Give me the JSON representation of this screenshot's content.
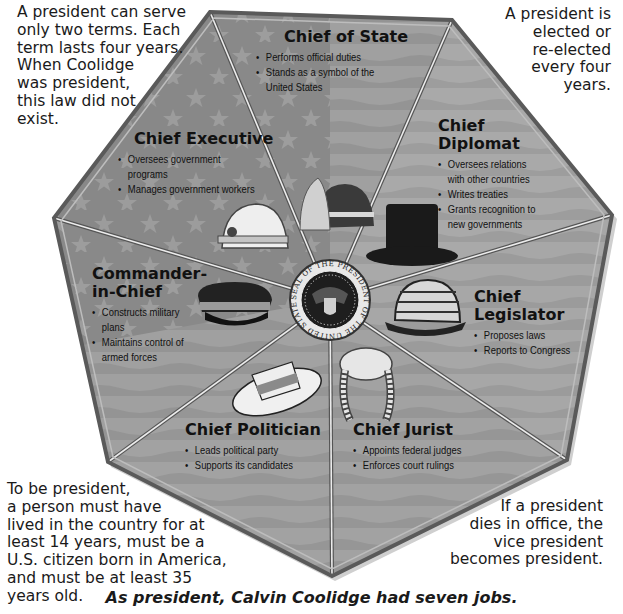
{
  "caption": "As president, Calvin Coolidge had seven jobs.",
  "notes": {
    "top_left": "A president can serve\nonly two terms.  Each\nterm lasts four years.\nWhen Coolidge\nwas president,\nthis law did not\nexist.",
    "top_right": "A president is\nelected or\nre-elected\nevery four\nyears.",
    "bottom_left": "To be president,\na person must have\nlived in the country for at\nleast 14 years, must be a\nU.S. citizen born in America,\nand must be at least 35\nyears old.",
    "bottom_right": "If a president\ndies in office, the\nvice president\nbecomes president."
  },
  "seal": {
    "text": "SEAL OF THE PRESIDENT OF THE UNITED STATES"
  },
  "jobs": [
    {
      "title": "Chief of State",
      "hat": "feathered-helmet",
      "duties": [
        "Performs official duties",
        "Stands as a symbol of the\nUnited States"
      ]
    },
    {
      "title": "Chief\nDiplomat",
      "hat": "top-hat",
      "duties": [
        "Oversees relations\nwith other countries",
        "Writes treaties",
        "Grants recognition to\nnew governments"
      ]
    },
    {
      "title": "Chief\nLegislator",
      "hat": "bowler-hat",
      "duties": [
        "Proposes laws",
        "Reports to Congress"
      ]
    },
    {
      "title": "Chief Jurist",
      "hat": "judge-wig",
      "duties": [
        "Appoints federal judges",
        "Enforces court rulings"
      ]
    },
    {
      "title": "Chief Politician",
      "hat": "straw-boater",
      "duties": [
        "Leads political party",
        "Supports its candidates"
      ]
    },
    {
      "title": "Commander-\nin-Chief",
      "hat": "military-cap",
      "duties": [
        "Constructs military\nplans",
        "Maintains control of\narmed forces"
      ]
    },
    {
      "title": "Chief Executive",
      "hat": "hard-hat",
      "duties": [
        "Oversees government\nprograms",
        "Manages government workers"
      ]
    }
  ],
  "colors": {
    "panel_light": "#a8a8a8",
    "panel_dark": "#8c8c8c",
    "stripe": "#9a9a9a",
    "border": "#555555",
    "divider": "#e6e6e6",
    "text": "#111111"
  }
}
